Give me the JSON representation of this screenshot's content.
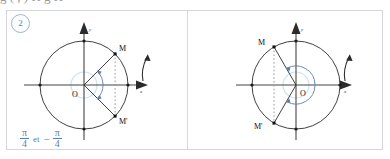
{
  "page": {
    "background": "#ffffff",
    "accent_blue": "#5b7fb0",
    "border_gray": "#d5d7da",
    "ink": "#1a1a1a",
    "cropped_top_text": "g        ( , )        H            g        H"
  },
  "exercise": {
    "number": "2",
    "badge_name": "exercise-number-2"
  },
  "panels": [
    {
      "id": "left",
      "diagram": {
        "center_label": "O",
        "x_axis_label": "x",
        "y_axis_label": "y",
        "point_labels": [
          "M",
          "M'"
        ],
        "angle_degrees": [
          45,
          -45
        ],
        "rotation_arrow": "counterclockwise-arrow"
      },
      "answer": {
        "first": {
          "num": "π",
          "den": "4",
          "sign": ""
        },
        "conjunction": "et",
        "second": {
          "num": "π",
          "den": "4",
          "sign": "−"
        },
        "text": "π/4 et −π/4"
      }
    },
    {
      "id": "right",
      "diagram": {
        "center_label": "O",
        "x_axis_label": "x",
        "y_axis_label": "y",
        "point_labels": [
          "M",
          "M'"
        ],
        "angle_degrees": [
          120,
          -120
        ],
        "rotation_arrow": "counterclockwise-arrow"
      },
      "answer": {
        "first": {
          "num": "2π",
          "den": "3",
          "sign": ""
        },
        "conjunction": "et",
        "second": {
          "num": "2π",
          "den": "3",
          "sign": "−"
        },
        "text": "2π/3 et −2π/3"
      }
    }
  ]
}
